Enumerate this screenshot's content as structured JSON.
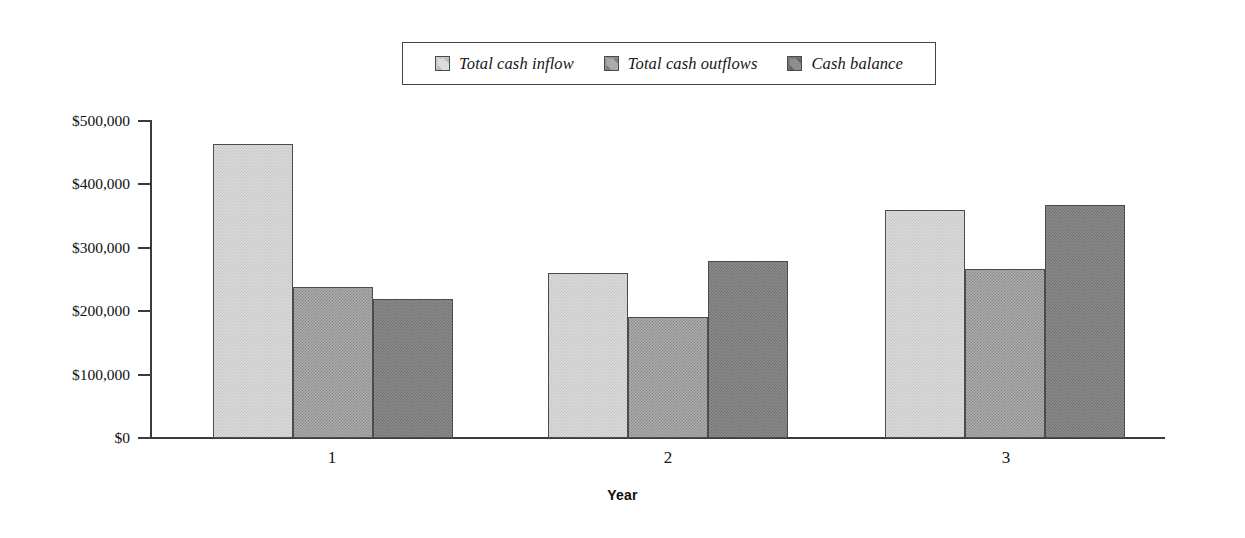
{
  "chart_data": {
    "type": "bar",
    "title": "",
    "subtitle": "",
    "xlabel": "Year",
    "ylabel": "",
    "categories": [
      "1",
      "2",
      "3"
    ],
    "series": [
      {
        "name": "Total cash inflow",
        "color": "#dcdcdc",
        "values": [
          462000,
          260000,
          358000
        ]
      },
      {
        "name": "Total cash outflows",
        "color": "#ababab",
        "values": [
          238000,
          191000,
          265000
        ]
      },
      {
        "name": "Cash balance",
        "color": "#8d8d8d",
        "values": [
          219000,
          279000,
          367000
        ]
      }
    ],
    "ylim": [
      0,
      500000
    ],
    "ytick_values": [
      0,
      100000,
      200000,
      300000,
      400000,
      500000
    ],
    "ytick_labels": [
      "$0",
      "$100,000",
      "$200,000",
      "$300,000",
      "$400,000",
      "$500,000"
    ],
    "grid": false,
    "legend_position": "top-center",
    "orientation": "vertical",
    "bar_group_mode": "grouped"
  },
  "legend": {
    "items": [
      {
        "label": "Total cash inflow"
      },
      {
        "label": "Total cash outflows"
      },
      {
        "label": "Cash balance"
      }
    ]
  },
  "axes": {
    "y_labels": [
      "$500,000",
      "$400,000",
      "$300,000",
      "$200,000",
      "$100,000",
      "$0"
    ],
    "x_labels": [
      "1",
      "2",
      "3"
    ],
    "x_title": "Year"
  }
}
